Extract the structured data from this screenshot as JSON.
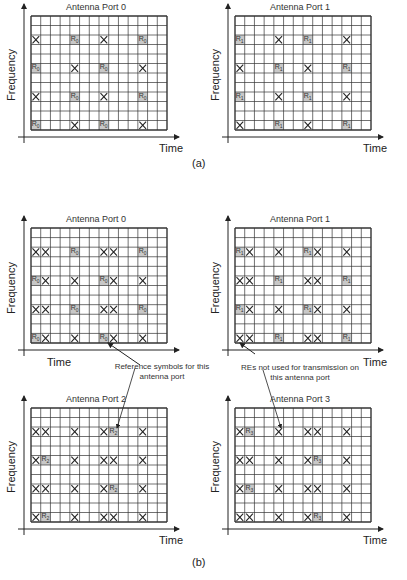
{
  "figure": {
    "caption_a": "(a)",
    "caption_b": "(b)",
    "axis_time": "Time",
    "axis_frequency": "Frequency",
    "grid": {
      "cols": 14,
      "rows": 12
    },
    "colors": {
      "grid_line": "#333333",
      "rs_fill": "#c8c8c8",
      "x_stroke": "#222222"
    },
    "annotations": {
      "reference_symbols": "Reference symbols for this antenna port",
      "res_not_used": "REs not used for transmission on this antenna port"
    }
  },
  "panels": [
    {
      "id": "a0",
      "title": "Antenna Port 0",
      "rs_label": "R0",
      "gx": 31,
      "gy": 16,
      "gw": 136,
      "gh": 114,
      "rs": [
        [
          2,
          4
        ],
        [
          2,
          11
        ],
        [
          5,
          0
        ],
        [
          5,
          7
        ],
        [
          8,
          4
        ],
        [
          8,
          11
        ],
        [
          11,
          0
        ],
        [
          11,
          7
        ]
      ],
      "x": [
        [
          2,
          0
        ],
        [
          2,
          7
        ],
        [
          5,
          4
        ],
        [
          5,
          11
        ],
        [
          8,
          0
        ],
        [
          8,
          7
        ],
        [
          11,
          4
        ],
        [
          11,
          11
        ]
      ]
    },
    {
      "id": "a1",
      "title": "Antenna Port 1",
      "rs_label": "R1",
      "gx": 235,
      "gy": 16,
      "gw": 136,
      "gh": 114,
      "rs": [
        [
          2,
          0
        ],
        [
          2,
          7
        ],
        [
          5,
          4
        ],
        [
          5,
          11
        ],
        [
          8,
          0
        ],
        [
          8,
          7
        ],
        [
          11,
          4
        ],
        [
          11,
          11
        ]
      ],
      "x": [
        [
          2,
          4
        ],
        [
          2,
          11
        ],
        [
          5,
          0
        ],
        [
          5,
          7
        ],
        [
          8,
          4
        ],
        [
          8,
          11
        ],
        [
          11,
          0
        ],
        [
          11,
          7
        ]
      ]
    },
    {
      "id": "b0",
      "title": "Antenna Port 0",
      "rs_label": "R0",
      "gx": 31,
      "gy": 228,
      "gw": 136,
      "gh": 115,
      "rs": [
        [
          2,
          4
        ],
        [
          2,
          11
        ],
        [
          5,
          0
        ],
        [
          5,
          7
        ],
        [
          8,
          4
        ],
        [
          8,
          11
        ],
        [
          11,
          0
        ],
        [
          11,
          7
        ]
      ],
      "x": [
        [
          2,
          0
        ],
        [
          2,
          1
        ],
        [
          2,
          7
        ],
        [
          2,
          8
        ],
        [
          5,
          1
        ],
        [
          5,
          4
        ],
        [
          5,
          8
        ],
        [
          5,
          11
        ],
        [
          8,
          0
        ],
        [
          8,
          1
        ],
        [
          8,
          7
        ],
        [
          8,
          8
        ],
        [
          11,
          1
        ],
        [
          11,
          4
        ],
        [
          11,
          8
        ],
        [
          11,
          11
        ]
      ]
    },
    {
      "id": "b1",
      "title": "Antenna Port 1",
      "rs_label": "R1",
      "gx": 235,
      "gy": 228,
      "gw": 136,
      "gh": 115,
      "rs": [
        [
          2,
          0
        ],
        [
          2,
          7
        ],
        [
          5,
          4
        ],
        [
          5,
          11
        ],
        [
          8,
          0
        ],
        [
          8,
          7
        ],
        [
          11,
          4
        ],
        [
          11,
          11
        ]
      ],
      "x": [
        [
          2,
          1
        ],
        [
          2,
          4
        ],
        [
          2,
          8
        ],
        [
          2,
          11
        ],
        [
          5,
          0
        ],
        [
          5,
          1
        ],
        [
          5,
          7
        ],
        [
          5,
          8
        ],
        [
          8,
          1
        ],
        [
          8,
          4
        ],
        [
          8,
          8
        ],
        [
          8,
          11
        ],
        [
          11,
          0
        ],
        [
          11,
          1
        ],
        [
          11,
          7
        ],
        [
          11,
          8
        ]
      ]
    },
    {
      "id": "b2",
      "title": "Antenna Port 2",
      "rs_label": "R2",
      "gx": 31,
      "gy": 408,
      "gw": 136,
      "gh": 114,
      "rs": [
        [
          2,
          8
        ],
        [
          5,
          1
        ],
        [
          8,
          8
        ],
        [
          11,
          1
        ]
      ],
      "x": [
        [
          2,
          0
        ],
        [
          2,
          1
        ],
        [
          2,
          4
        ],
        [
          2,
          7
        ],
        [
          2,
          11
        ],
        [
          5,
          0
        ],
        [
          5,
          4
        ],
        [
          5,
          7
        ],
        [
          5,
          8
        ],
        [
          5,
          11
        ],
        [
          8,
          0
        ],
        [
          8,
          1
        ],
        [
          8,
          4
        ],
        [
          8,
          7
        ],
        [
          8,
          11
        ],
        [
          11,
          0
        ],
        [
          11,
          4
        ],
        [
          11,
          7
        ],
        [
          11,
          8
        ],
        [
          11,
          11
        ]
      ]
    },
    {
      "id": "b3",
      "title": "Antenna Port 3",
      "rs_label": "R3",
      "gx": 235,
      "gy": 408,
      "gw": 136,
      "gh": 114,
      "rs": [
        [
          2,
          1
        ],
        [
          5,
          8
        ],
        [
          8,
          1
        ],
        [
          11,
          8
        ]
      ],
      "x": [
        [
          2,
          0
        ],
        [
          2,
          4
        ],
        [
          2,
          7
        ],
        [
          2,
          8
        ],
        [
          2,
          11
        ],
        [
          5,
          0
        ],
        [
          5,
          1
        ],
        [
          5,
          4
        ],
        [
          5,
          7
        ],
        [
          5,
          11
        ],
        [
          8,
          0
        ],
        [
          8,
          4
        ],
        [
          8,
          7
        ],
        [
          8,
          8
        ],
        [
          8,
          11
        ],
        [
          11,
          0
        ],
        [
          11,
          1
        ],
        [
          11,
          4
        ],
        [
          11,
          7
        ],
        [
          11,
          11
        ]
      ]
    }
  ]
}
